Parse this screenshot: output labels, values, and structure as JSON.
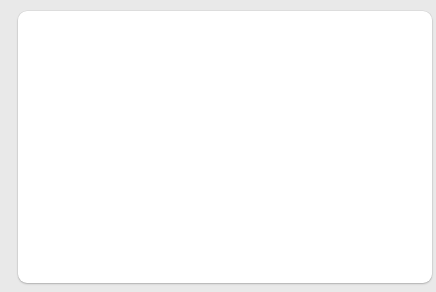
{
  "chart_data": {
    "type": "line",
    "title": "",
    "xlabel": "Year",
    "ylabel": "Exports and imports relative to GDP (%)",
    "xlim": [
      1929,
      2013
    ],
    "ylim": [
      0,
      20
    ],
    "ytick_step": 2,
    "xtick_step": 5,
    "grid": false,
    "legend": "inline-annotations",
    "yticks": [
      0,
      2,
      4,
      6,
      8,
      10,
      12,
      14,
      16,
      18,
      20
    ],
    "xticks_labeled": [
      1929,
      1939,
      1949,
      1959,
      1969,
      1979,
      1989,
      1999,
      2009
    ],
    "xticks_all": [
      1929,
      1934,
      1939,
      1944,
      1949,
      1954,
      1959,
      1964,
      1969,
      1974,
      1979,
      1984,
      1989,
      1994,
      1999,
      2004,
      2009
    ],
    "annotations": [
      {
        "text": "U.S. imports",
        "x": 1988,
        "y": 14.5
      },
      {
        "text": "U.S. exports",
        "x": 2000,
        "y": 7.8
      }
    ],
    "series": [
      {
        "name": "U.S. imports",
        "color": "#a33a28",
        "x": [
          1929,
          1930,
          1931,
          1932,
          1933,
          1934,
          1935,
          1936,
          1937,
          1938,
          1939,
          1940,
          1941,
          1942,
          1943,
          1944,
          1945,
          1946,
          1947,
          1948,
          1949,
          1950,
          1951,
          1952,
          1953,
          1954,
          1955,
          1956,
          1957,
          1958,
          1959,
          1960,
          1961,
          1962,
          1963,
          1964,
          1965,
          1966,
          1967,
          1968,
          1969,
          1970,
          1971,
          1972,
          1973,
          1974,
          1975,
          1976,
          1977,
          1978,
          1979,
          1980,
          1981,
          1982,
          1983,
          1984,
          1985,
          1986,
          1987,
          1988,
          1989,
          1990,
          1991,
          1992,
          1993,
          1994,
          1995,
          1996,
          1997,
          1998,
          1999,
          2000,
          2001,
          2002,
          2003,
          2004,
          2005,
          2006,
          2007,
          2008,
          2009,
          2010,
          2011,
          2012,
          2013
        ],
        "y": [
          5.6,
          4.7,
          4.0,
          3.3,
          3.1,
          3.2,
          3.4,
          3.4,
          3.7,
          3.0,
          3.1,
          3.1,
          3.2,
          2.8,
          2.6,
          2.7,
          3.2,
          3.3,
          3.2,
          3.6,
          3.5,
          4.0,
          4.1,
          4.0,
          3.9,
          3.9,
          4.1,
          4.3,
          4.2,
          4.1,
          4.4,
          4.3,
          4.1,
          4.2,
          4.2,
          4.2,
          4.4,
          4.8,
          4.9,
          5.3,
          5.3,
          5.4,
          5.6,
          6.0,
          6.8,
          8.3,
          7.7,
          8.2,
          8.9,
          9.3,
          10.1,
          10.4,
          10.2,
          9.3,
          9.0,
          9.9,
          9.9,
          10.1,
          10.5,
          10.4,
          10.5,
          10.7,
          10.1,
          10.2,
          10.4,
          11.1,
          11.6,
          11.7,
          11.9,
          11.9,
          12.5,
          14.4,
          13.0,
          13.1,
          13.6,
          14.7,
          15.6,
          16.3,
          16.4,
          17.6,
          13.9,
          15.9,
          17.3,
          17.0,
          16.7
        ]
      },
      {
        "name": "U.S. exports",
        "color": "#1d5870",
        "x": [
          1929,
          1930,
          1931,
          1932,
          1933,
          1934,
          1935,
          1936,
          1937,
          1938,
          1939,
          1940,
          1941,
          1942,
          1943,
          1944,
          1945,
          1946,
          1947,
          1948,
          1949,
          1950,
          1951,
          1952,
          1953,
          1954,
          1955,
          1956,
          1957,
          1958,
          1959,
          1960,
          1961,
          1962,
          1963,
          1964,
          1965,
          1966,
          1967,
          1968,
          1969,
          1970,
          1971,
          1972,
          1973,
          1974,
          1975,
          1976,
          1977,
          1978,
          1979,
          1980,
          1981,
          1982,
          1983,
          1984,
          1985,
          1986,
          1987,
          1988,
          1989,
          1990,
          1991,
          1992,
          1993,
          1994,
          1995,
          1996,
          1997,
          1998,
          1999,
          2000,
          2001,
          2002,
          2003,
          2004,
          2005,
          2006,
          2007,
          2008,
          2009,
          2010,
          2011,
          2012,
          2013
        ],
        "y": [
          5.5,
          4.4,
          3.6,
          3.5,
          3.7,
          4.1,
          3.8,
          3.7,
          4.6,
          4.6,
          4.3,
          4.4,
          3.5,
          2.6,
          2.0,
          2.2,
          3.2,
          5.7,
          7.5,
          5.8,
          5.6,
          4.2,
          5.4,
          5.1,
          4.4,
          4.6,
          4.7,
          5.4,
          5.6,
          4.6,
          4.3,
          5.2,
          5.1,
          5.0,
          5.1,
          5.4,
          5.2,
          5.2,
          5.1,
          5.2,
          5.3,
          5.6,
          5.4,
          5.6,
          6.7,
          8.3,
          8.3,
          8.0,
          7.8,
          8.1,
          9.0,
          10.0,
          9.6,
          8.7,
          7.8,
          7.5,
          7.2,
          7.2,
          7.6,
          8.6,
          9.3,
          9.6,
          9.9,
          9.9,
          9.7,
          10.0,
          10.7,
          10.8,
          11.2,
          10.6,
          10.2,
          10.7,
          9.7,
          9.2,
          9.2,
          9.8,
          10.2,
          10.9,
          11.7,
          12.8,
          11.0,
          12.3,
          13.5,
          13.6,
          13.6
        ]
      }
    ]
  }
}
